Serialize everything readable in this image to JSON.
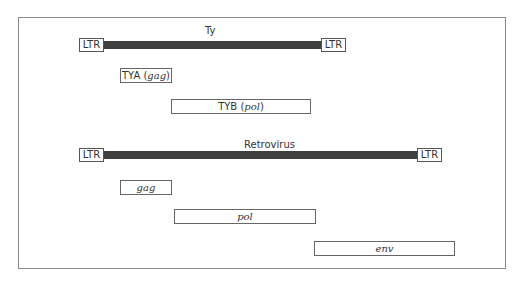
{
  "ty": {
    "title": "Ty",
    "ltr_left": "LTR",
    "ltr_right": "LTR",
    "genes": [
      {
        "name": "TYA",
        "product": "gag"
      },
      {
        "name": "TYB",
        "product": "pol"
      }
    ]
  },
  "retrovirus": {
    "title": "Retrovirus",
    "ltr_left": "LTR",
    "ltr_right": "LTR",
    "genes": [
      {
        "product": "gag"
      },
      {
        "product": "pol"
      },
      {
        "product": "env"
      }
    ]
  },
  "colors": {
    "bar": "#3f3f3f",
    "border": "#8a8a8a"
  }
}
